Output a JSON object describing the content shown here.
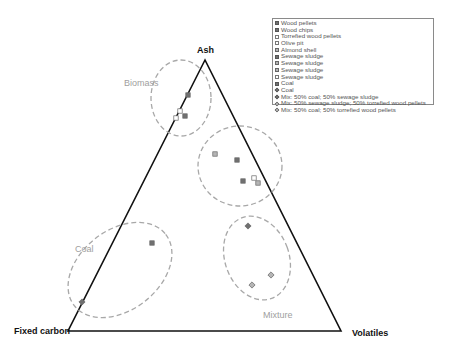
{
  "chart_data": {
    "type": "scatter",
    "subtype": "ternary",
    "title": "",
    "axes": {
      "top": "Ash",
      "left": "Fixed carbon",
      "right": "Volatiles"
    },
    "vertices_px": {
      "top": [
        205,
        60
      ],
      "left": [
        68,
        331
      ],
      "right": [
        341,
        331
      ]
    },
    "legend": {
      "position": "top-right",
      "items": [
        {
          "label": "Wood pellets",
          "marker": "square-filled"
        },
        {
          "label": "Wood chips",
          "marker": "square-filled"
        },
        {
          "label": "Torrefied wood pellets",
          "marker": "square-hollow"
        },
        {
          "label": "Olive pit",
          "marker": "square-hollow"
        },
        {
          "label": "Almond shell",
          "marker": "square-light"
        },
        {
          "label": "Sewage sludge",
          "marker": "square-filled"
        },
        {
          "label": "Sewage sludge",
          "marker": "square-light"
        },
        {
          "label": "Sewage sludge",
          "marker": "square-light"
        },
        {
          "label": "Sewage sludge",
          "marker": "square-hollow"
        },
        {
          "label": "Coal",
          "marker": "square-filled"
        },
        {
          "label": "Coal",
          "marker": "diamond-filled"
        },
        {
          "label": "Mix: 50% coal; 50% sewage sludge",
          "marker": "diamond-filled"
        },
        {
          "label": "Mix: 50% sewage sludge; 50% torrefied wood pellets",
          "marker": "diamond-light"
        },
        {
          "label": "Mix: 50% coal; 50% torrefied wood pellets",
          "marker": "diamond-light"
        }
      ]
    },
    "clusters": [
      {
        "label": "Biomass",
        "ellipse": {
          "cx": 181,
          "cy": 98,
          "rx": 30,
          "ry": 38,
          "rot": 0
        },
        "label_pos": [
          151,
          82
        ]
      },
      {
        "label": "",
        "ellipse": {
          "cx": 240,
          "cy": 166,
          "rx": 42,
          "ry": 40,
          "rot": 0
        }
      },
      {
        "label": "Coal",
        "ellipse": {
          "cx": 120,
          "cy": 270,
          "rx": 58,
          "ry": 40,
          "rot": -38
        },
        "label_pos": [
          75,
          249
        ]
      },
      {
        "label": "Mixture",
        "ellipse": {
          "cx": 257,
          "cy": 258,
          "rx": 32,
          "ry": 43,
          "rot": -20
        },
        "label_pos": [
          265,
          314
        ]
      }
    ],
    "points": [
      {
        "series": "Wood pellets",
        "x": 188,
        "y": 95,
        "marker": "square-filled"
      },
      {
        "series": "Wood chips",
        "x": 185,
        "y": 116,
        "marker": "square-filled"
      },
      {
        "series": "Torrefied wood pellets",
        "x": 180,
        "y": 111,
        "marker": "square-hollow"
      },
      {
        "series": "Olive pit",
        "x": 176,
        "y": 118,
        "marker": "square-hollow"
      },
      {
        "series": "Sewage sludge",
        "x": 215,
        "y": 154,
        "marker": "square-light"
      },
      {
        "series": "Sewage sludge",
        "x": 237,
        "y": 160,
        "marker": "square-filled"
      },
      {
        "series": "Sewage sludge",
        "x": 243,
        "y": 181,
        "marker": "square-filled"
      },
      {
        "series": "Sewage sludge",
        "x": 254,
        "y": 178,
        "marker": "square-hollow"
      },
      {
        "series": "Almond shell",
        "x": 258,
        "y": 183,
        "marker": "square-light"
      },
      {
        "series": "Coal",
        "x": 152,
        "y": 243,
        "marker": "square-filled"
      },
      {
        "series": "Coal",
        "x": 82,
        "y": 302,
        "marker": "diamond-filled"
      },
      {
        "series": "Mix: 50% coal; 50% sewage sludge",
        "x": 248,
        "y": 226,
        "marker": "diamond-filled"
      },
      {
        "series": "Mix: 50% sewage sludge; 50% torrefied wood pellets",
        "x": 271,
        "y": 275,
        "marker": "diamond-light"
      },
      {
        "series": "Mix: 50% coal; 50% torrefied wood pellets",
        "x": 252,
        "y": 285,
        "marker": "diamond-light"
      }
    ]
  },
  "labels": {
    "top": "Ash",
    "left": "Fixed carbon",
    "right": "Volatiles",
    "biomass": "Biomass",
    "coal": "Coal",
    "mixture": "Mixture"
  }
}
